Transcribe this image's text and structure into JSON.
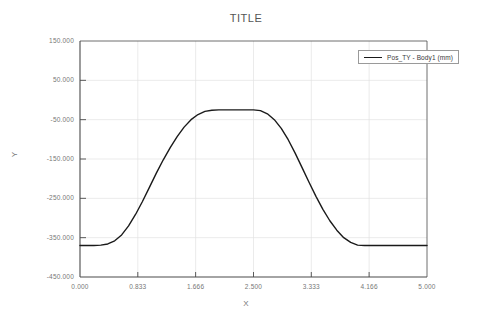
{
  "chart_data": {
    "type": "line",
    "title": "TITLE",
    "xlabel": "X",
    "ylabel": "Y",
    "xlim": [
      0.0,
      5.0
    ],
    "ylim": [
      -450.0,
      150.0
    ],
    "grid": true,
    "legend_position": "top-right",
    "xticks": [
      0.0,
      0.833,
      1.666,
      2.5,
      3.333,
      4.166,
      5.0
    ],
    "xtick_labels": [
      "0.000",
      "0.833",
      "1.666",
      "2.500",
      "3.333",
      "4.166",
      "5.000"
    ],
    "yticks": [
      150,
      50,
      -50,
      -150,
      -250,
      -350,
      -450
    ],
    "ytick_labels": [
      "150.000",
      "50.000",
      "-50.000",
      "-150.000",
      "-250.000",
      "-350.000",
      "-450.000"
    ],
    "series": [
      {
        "name": "Pos_TY - Body1 (mm)",
        "color": "#1a1a1a",
        "x": [
          0.0,
          0.1,
          0.2,
          0.3,
          0.4,
          0.5,
          0.6,
          0.7,
          0.8,
          0.9,
          1.0,
          1.1,
          1.2,
          1.3,
          1.4,
          1.5,
          1.6,
          1.7,
          1.8,
          1.9,
          2.0,
          2.1,
          2.2,
          2.3,
          2.4,
          2.5,
          2.6,
          2.7,
          2.8,
          2.9,
          3.0,
          3.1,
          3.2,
          3.3,
          3.4,
          3.5,
          3.6,
          3.7,
          3.8,
          3.9,
          4.0,
          4.1,
          4.2,
          4.3,
          4.4,
          4.5,
          4.6,
          4.7,
          4.8,
          4.9,
          5.0
        ],
        "y": [
          -370,
          -370,
          -370,
          -369,
          -366,
          -358,
          -343,
          -320,
          -291,
          -258,
          -222,
          -186,
          -152,
          -121,
          -93,
          -69,
          -50,
          -37,
          -29,
          -26,
          -25,
          -25,
          -25,
          -25,
          -25,
          -25,
          -27,
          -35,
          -50,
          -72,
          -101,
          -135,
          -172,
          -209,
          -245,
          -278,
          -307,
          -331,
          -350,
          -362,
          -369,
          -370,
          -370,
          -370,
          -370,
          -370,
          -370,
          -370,
          -370,
          -370,
          -370
        ]
      }
    ]
  },
  "legend": {
    "entries": [
      {
        "label": "Pos_TY - Body1 (mm)",
        "swatch": "line-swatch"
      }
    ]
  },
  "axes": {
    "title": "TITLE",
    "x_label": "X",
    "y_label": "Y"
  },
  "colors": {
    "series_line": "#1a1a1a",
    "grid": "#e2e2e2",
    "axis": "#4a4a4a",
    "tick_text": "#777777",
    "title_text": "#555555"
  }
}
